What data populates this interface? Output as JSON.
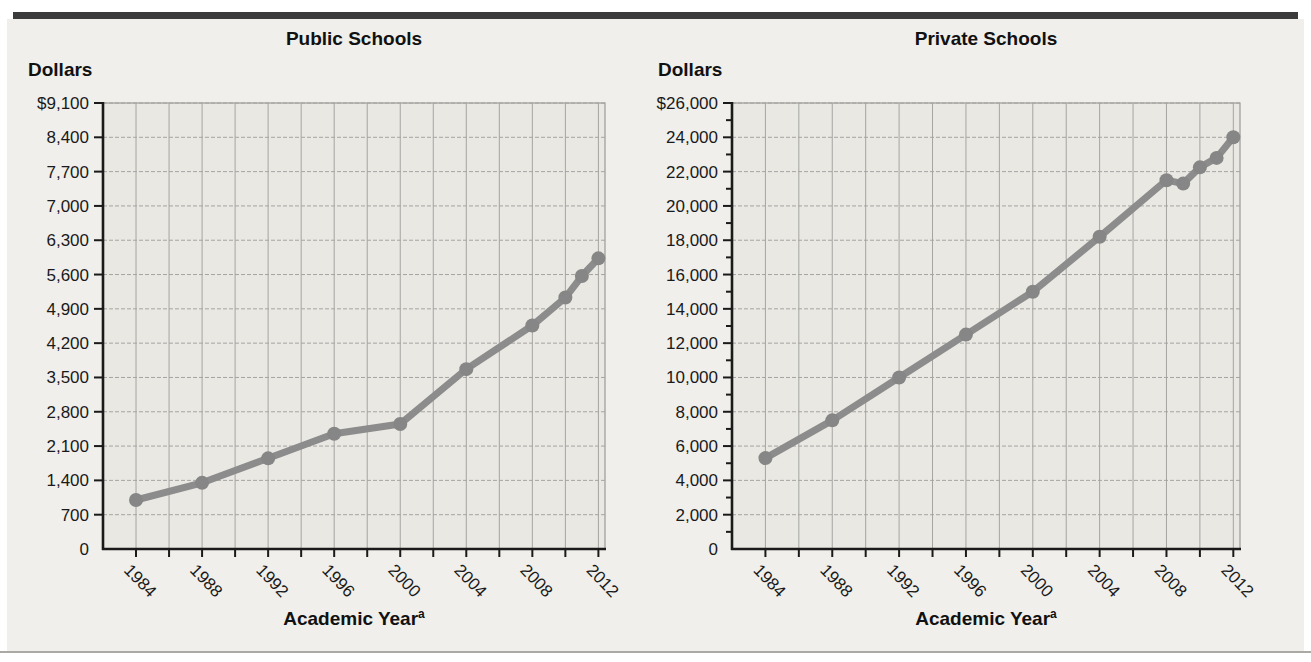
{
  "style": {
    "figure_background": "#f0efeb",
    "plot_background": "#eae8e3",
    "grid_color": "#a5a4a1",
    "border_color": "#9c9a96",
    "axis_color": "#1a1a1a",
    "line_color": "#8c8c8c",
    "marker_color": "#868686",
    "top_bar_color": "#3b3b3b",
    "divider_color": "#aba9a4"
  },
  "chart_data": [
    {
      "type": "line",
      "title": "Public Schools",
      "ylabel": "Dollars",
      "xlabel": "Academic Year",
      "xlabel_note": "a",
      "x": [
        1984,
        1988,
        1992,
        1996,
        2000,
        2004,
        2008,
        2010,
        2011,
        2012
      ],
      "values": [
        1000,
        1350,
        1850,
        2350,
        2550,
        3670,
        4560,
        5130,
        5570,
        5930
      ],
      "ylim": [
        0,
        9100
      ],
      "y_label_step": 700,
      "y_minor_step": 0,
      "y_tick_labels": [
        "$9,100",
        "8,400",
        "7,700",
        "7,000",
        "6,300",
        "5,600",
        "4,900",
        "4,200",
        "3,500",
        "2,800",
        "2,100",
        "1,400",
        "700",
        "0"
      ],
      "xlim": [
        1982,
        2012.4
      ],
      "x_gridline_years": [
        1984,
        1986,
        1988,
        1990,
        1992,
        1994,
        1996,
        1998,
        2000,
        2002,
        2004,
        2006,
        2008,
        2010,
        2012
      ],
      "x_labeled_years": [
        1984,
        1988,
        1992,
        1996,
        2000,
        2004,
        2008,
        2012
      ],
      "x_tick_labels": [
        "1984",
        "1988",
        "1992",
        "1996",
        "2000",
        "2004",
        "2008",
        "2012"
      ],
      "grid": true,
      "legend": null
    },
    {
      "type": "line",
      "title": "Private Schools",
      "ylabel": "Dollars",
      "xlabel": "Academic Year",
      "xlabel_note": "a",
      "x": [
        1984,
        1988,
        1992,
        1996,
        2000,
        2004,
        2008,
        2009,
        2010,
        2011,
        2012
      ],
      "values": [
        5300,
        7500,
        10000,
        12500,
        15000,
        18200,
        21500,
        21300,
        22250,
        22800,
        24000
      ],
      "ylim": [
        0,
        26000
      ],
      "y_label_step": 2000,
      "y_minor_step": 1000,
      "y_tick_labels": [
        "$26,000",
        "24,000",
        "22,000",
        "20,000",
        "18,000",
        "16,000",
        "14,000",
        "12,000",
        "10,000",
        "8,000",
        "6,000",
        "4,000",
        "2,000",
        "0"
      ],
      "xlim": [
        1982,
        2012.4
      ],
      "x_gridline_years": [
        1984,
        1986,
        1988,
        1990,
        1992,
        1994,
        1996,
        1998,
        2000,
        2002,
        2004,
        2006,
        2008,
        2010,
        2012
      ],
      "x_labeled_years": [
        1984,
        1988,
        1992,
        1996,
        2000,
        2004,
        2008,
        2012
      ],
      "x_tick_labels": [
        "1984",
        "1988",
        "1992",
        "1996",
        "2000",
        "2004",
        "2008",
        "2012"
      ],
      "grid": true,
      "legend": null
    }
  ]
}
